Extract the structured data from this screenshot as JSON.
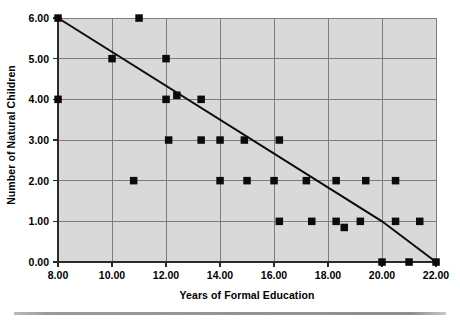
{
  "chart_data": {
    "type": "scatter",
    "title": "",
    "xlabel": "Years of Formal Education",
    "ylabel": "Number of Natural Children",
    "xlim": [
      8,
      22
    ],
    "ylim": [
      0,
      6
    ],
    "xticks": [
      "8.00",
      "10.00",
      "12.00",
      "14.00",
      "16.00",
      "18.00",
      "20.00",
      "22.00"
    ],
    "xtick_values": [
      8,
      10,
      12,
      14,
      16,
      18,
      20,
      22
    ],
    "yticks": [
      "0.00",
      "1.00",
      "2.00",
      "3.00",
      "4.00",
      "5.00",
      "6.00"
    ],
    "ytick_values": [
      0,
      1,
      2,
      3,
      4,
      5,
      6
    ],
    "grid": true,
    "legend": "none",
    "marker_style": "filled-square",
    "marker_color": "#0b0b0b",
    "plot_background": "#d9d9d9",
    "points": [
      {
        "x": 8.0,
        "y": 6.0
      },
      {
        "x": 11.0,
        "y": 6.0
      },
      {
        "x": 10.0,
        "y": 5.0
      },
      {
        "x": 12.0,
        "y": 5.0
      },
      {
        "x": 8.0,
        "y": 4.0
      },
      {
        "x": 12.0,
        "y": 4.0
      },
      {
        "x": 12.4,
        "y": 4.1
      },
      {
        "x": 13.3,
        "y": 4.0
      },
      {
        "x": 12.1,
        "y": 3.0
      },
      {
        "x": 13.3,
        "y": 3.0
      },
      {
        "x": 14.0,
        "y": 3.0
      },
      {
        "x": 14.9,
        "y": 3.0
      },
      {
        "x": 16.2,
        "y": 3.0
      },
      {
        "x": 10.8,
        "y": 2.0
      },
      {
        "x": 14.0,
        "y": 2.0
      },
      {
        "x": 15.0,
        "y": 2.0
      },
      {
        "x": 16.0,
        "y": 2.0
      },
      {
        "x": 17.2,
        "y": 2.0
      },
      {
        "x": 18.3,
        "y": 2.0
      },
      {
        "x": 19.4,
        "y": 2.0
      },
      {
        "x": 20.5,
        "y": 2.0
      },
      {
        "x": 16.2,
        "y": 1.0
      },
      {
        "x": 17.4,
        "y": 1.0
      },
      {
        "x": 18.3,
        "y": 1.0
      },
      {
        "x": 18.6,
        "y": 0.85
      },
      {
        "x": 19.2,
        "y": 1.0
      },
      {
        "x": 20.5,
        "y": 1.0
      },
      {
        "x": 21.4,
        "y": 1.0
      },
      {
        "x": 20.0,
        "y": 0.0
      },
      {
        "x": 21.0,
        "y": 0.0
      },
      {
        "x": 22.0,
        "y": 0.0
      }
    ],
    "fit_line": {
      "label": "fit-line",
      "vertices": [
        {
          "x": 8.0,
          "y": 6.0
        },
        {
          "x": 20.0,
          "y": 1.0
        },
        {
          "x": 22.0,
          "y": 0.0
        }
      ]
    }
  }
}
